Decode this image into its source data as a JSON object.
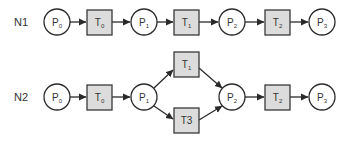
{
  "diagram": {
    "type": "petri-net",
    "colors": {
      "place_fill": "#ffffff",
      "transition_fill": "#dcdcdc",
      "stroke": "#2a2a2a",
      "text": "#333333"
    },
    "nets": [
      {
        "label": "N1",
        "places": [
          {
            "base": "P",
            "sub": "0"
          },
          {
            "base": "P",
            "sub": "1"
          },
          {
            "base": "P",
            "sub": "2"
          },
          {
            "base": "P",
            "sub": "3"
          }
        ],
        "transitions": [
          {
            "base": "T",
            "sub": "0"
          },
          {
            "base": "T",
            "sub": "1"
          },
          {
            "base": "T",
            "sub": "2"
          }
        ],
        "arcs": [
          [
            "P0",
            "T0"
          ],
          [
            "T0",
            "P1"
          ],
          [
            "P1",
            "T1"
          ],
          [
            "T1",
            "P2"
          ],
          [
            "P2",
            "T2"
          ],
          [
            "T2",
            "P3"
          ]
        ]
      },
      {
        "label": "N2",
        "places": [
          {
            "base": "P",
            "sub": "0"
          },
          {
            "base": "P",
            "sub": "1"
          },
          {
            "base": "P",
            "sub": "2"
          },
          {
            "base": "P",
            "sub": "3"
          }
        ],
        "transitions": [
          {
            "base": "T",
            "sub": "0"
          },
          {
            "base": "T",
            "sub": "1"
          },
          {
            "base": "T3",
            "sub": ""
          },
          {
            "base": "T",
            "sub": "2"
          }
        ],
        "arcs": [
          [
            "P0",
            "T0"
          ],
          [
            "T0",
            "P1"
          ],
          [
            "P1",
            "T1"
          ],
          [
            "P1",
            "T3"
          ],
          [
            "T1",
            "P2"
          ],
          [
            "T3",
            "P2"
          ],
          [
            "P2",
            "T2"
          ],
          [
            "T2",
            "P3"
          ]
        ]
      }
    ]
  }
}
